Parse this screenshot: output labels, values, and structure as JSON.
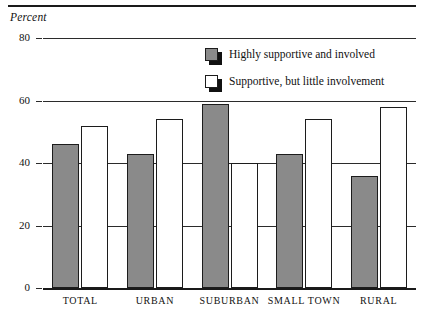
{
  "axis_title": "Percent",
  "legend": {
    "items": [
      {
        "label": "Highly supportive and involved",
        "swatch": "gray",
        "color": "#8a8a8a"
      },
      {
        "label": "Supportive, but little involvement",
        "swatch": "white",
        "color": "#ffffff"
      }
    ]
  },
  "ticks": {
    "t80": "80",
    "t60": "60",
    "t40": "40",
    "t20": "20",
    "t0": "0"
  },
  "categories_labels": {
    "c0": "TOTAL",
    "c1": "URBAN",
    "c2": "SUBURBAN",
    "c3": "SMALL TOWN",
    "c4": "RURAL"
  },
  "chart_data": {
    "type": "bar",
    "title": "",
    "xlabel": "",
    "ylabel": "Percent",
    "ylim": [
      0,
      80
    ],
    "yticks": [
      0,
      20,
      40,
      60,
      80
    ],
    "grid": true,
    "legend_position": "top-right-inside",
    "categories": [
      "TOTAL",
      "URBAN",
      "SUBURBAN",
      "SMALL TOWN",
      "RURAL"
    ],
    "series": [
      {
        "name": "Highly supportive and involved",
        "color": "#8a8a8a",
        "values": [
          46,
          43,
          59,
          43,
          36
        ]
      },
      {
        "name": "Supportive, but little involvement",
        "color": "#ffffff",
        "values": [
          52,
          54,
          40,
          54,
          58
        ]
      }
    ]
  }
}
